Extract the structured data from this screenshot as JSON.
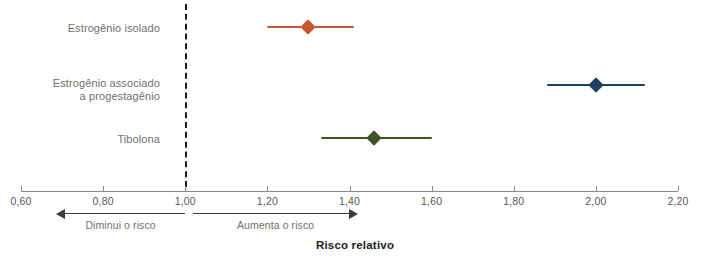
{
  "chart_data": {
    "type": "scatter",
    "subtype": "forest-plot",
    "title": "",
    "xlabel": "Risco relativo",
    "ylabel": "",
    "xlim": [
      0.6,
      2.2
    ],
    "xticks": [
      "0,60",
      "0,80",
      "1,00",
      "1,20",
      "1,40",
      "1,60",
      "1,80",
      "2,00",
      "2,20"
    ],
    "xtick_values": [
      0.6,
      0.8,
      1.0,
      1.2,
      1.4,
      1.6,
      1.8,
      2.0,
      2.2
    ],
    "grid": false,
    "legend": "none",
    "reference_line": {
      "value": 1.0,
      "style": "dashed",
      "color": "#1d1d1b"
    },
    "categories": [
      "Estrogênio isolado",
      "Estrogênio associado\na progestagênio",
      "Tibolona"
    ],
    "values": [
      1.3,
      2.0,
      1.46
    ],
    "ci_low": [
      1.2,
      1.88,
      1.33
    ],
    "ci_high": [
      1.41,
      2.12,
      1.6
    ],
    "colors": [
      "#C85A32",
      "#1F4264",
      "#3E5426"
    ],
    "annotations": [
      {
        "text": "Diminui o risco",
        "direction": "left",
        "from": 1.0,
        "to": 0.685
      },
      {
        "text": "Aumenta o risco",
        "direction": "right",
        "from": 1.02,
        "to": 1.42
      }
    ]
  },
  "axis": {
    "title": "Risco relativo",
    "tick_color": "#55565a",
    "line_color": "#8a8a8a"
  },
  "annotations": {
    "decrease": "Diminui o risco",
    "increase": "Aumenta o risco"
  },
  "series": [
    {
      "label": "Estrogênio isolado",
      "estimate": 1.3,
      "low": 1.2,
      "high": 1.41,
      "color": "#C85A32"
    },
    {
      "label": "Estrogênio associado\na progestagênio",
      "estimate": 2.0,
      "low": 1.88,
      "high": 2.12,
      "color": "#1F4264"
    },
    {
      "label": "Tibolona",
      "estimate": 1.46,
      "low": 1.33,
      "high": 1.6,
      "color": "#3E5426"
    }
  ]
}
